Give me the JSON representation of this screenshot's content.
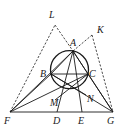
{
  "diagram": {
    "type": "geometry",
    "points": {
      "A": {
        "label": "A"
      },
      "B": {
        "label": "B"
      },
      "C": {
        "label": "C"
      },
      "D": {
        "label": "D"
      },
      "E": {
        "label": "E"
      },
      "F": {
        "label": "F"
      },
      "G": {
        "label": "G"
      },
      "K": {
        "label": "K"
      },
      "L": {
        "label": "L"
      },
      "M": {
        "label": "M"
      },
      "N": {
        "label": "N"
      }
    },
    "circle": {
      "through": [
        "A",
        "B",
        "C"
      ]
    },
    "solid_segments": [
      [
        "F",
        "G"
      ],
      [
        "B",
        "C"
      ],
      [
        "A",
        "B"
      ],
      [
        "A",
        "C"
      ],
      [
        "F",
        "B"
      ],
      [
        "G",
        "C"
      ],
      [
        "F",
        "C"
      ],
      [
        "G",
        "B"
      ],
      [
        "A",
        "D"
      ],
      [
        "A",
        "E"
      ],
      [
        "B",
        "N"
      ],
      [
        "C",
        "M"
      ],
      [
        "F",
        "A"
      ],
      [
        "G",
        "A"
      ]
    ],
    "dashed_segments": [
      [
        "F",
        "L"
      ],
      [
        "L",
        "A"
      ],
      [
        "A",
        "K"
      ],
      [
        "K",
        "G"
      ]
    ]
  }
}
